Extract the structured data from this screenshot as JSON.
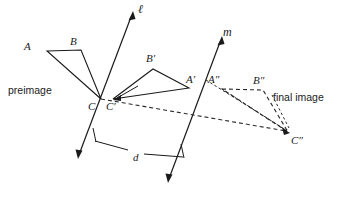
{
  "figure": {
    "type": "geometry-diagram",
    "width": 342,
    "height": 198,
    "background_color": "#ffffff",
    "stroke_color": "#1a1a1a"
  },
  "captions": {
    "preimage": "preimage",
    "final_image": "final image"
  },
  "lines": [
    {
      "id": "line-l",
      "label": "ℓ",
      "style": "solid",
      "label_x": 140,
      "label_y": 13
    },
    {
      "id": "line-m",
      "label": "m",
      "style": "solid",
      "label_x": 225,
      "label_y": 36
    }
  ],
  "measure": {
    "label": "d",
    "label_x": 134,
    "label_y": 161
  },
  "shapes": [
    {
      "id": "preimage-triangle",
      "name": "triangle-ABC",
      "style": "solid",
      "vertices": [
        {
          "label": "A",
          "x": 47,
          "y": 51,
          "label_x": 24,
          "label_y": 50
        },
        {
          "label": "B",
          "x": 81,
          "y": 50,
          "label_x": 70,
          "label_y": 45
        },
        {
          "label": "C",
          "x": 101,
          "y": 99,
          "label_x": 88,
          "label_y": 110
        }
      ]
    },
    {
      "id": "image-triangle",
      "name": "triangle-A-prime-B-prime-C-prime",
      "style": "solid",
      "vertices": [
        {
          "label": "A′",
          "x": 189,
          "y": 88,
          "label_x": 186,
          "label_y": 83
        },
        {
          "label": "B′",
          "x": 153,
          "y": 69,
          "label_x": 146,
          "label_y": 62
        },
        {
          "label": "C′",
          "x": 113,
          "y": 99,
          "label_x": 108,
          "label_y": 110
        }
      ]
    },
    {
      "id": "final-image-triangle",
      "name": "triangle-A-double-prime-B-double-prime-C-double-prime",
      "style": "dashed",
      "vertices": [
        {
          "label": "A″",
          "x": 222,
          "y": 89,
          "label_x": 209,
          "label_y": 83
        },
        {
          "label": "B″",
          "x": 263,
          "y": 90,
          "label_x": 254,
          "label_y": 84
        },
        {
          "label": "C″",
          "x": 288,
          "y": 132,
          "label_x": 292,
          "label_y": 143
        }
      ]
    }
  ]
}
